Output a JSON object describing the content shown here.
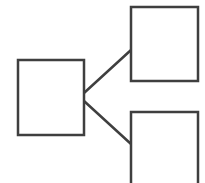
{
  "diagram": {
    "type": "tree",
    "stroke_color": "#3f3f3f",
    "fill_color": "#ffffff",
    "background": "#ffffff",
    "stroke_width": 2.5,
    "nodes": [
      {
        "id": "root",
        "label": "",
        "x": 18,
        "y": 60,
        "w": 66,
        "h": 75
      },
      {
        "id": "child-top",
        "label": "",
        "x": 131,
        "y": 7,
        "w": 67,
        "h": 74
      },
      {
        "id": "child-bottom",
        "label": "",
        "x": 131,
        "y": 112,
        "w": 67,
        "h": 80
      }
    ],
    "edges": [
      {
        "from": "root",
        "to": "child-top",
        "x1": 84,
        "y1": 93,
        "x2": 131,
        "y2": 50
      },
      {
        "from": "root",
        "to": "child-bottom",
        "x1": 84,
        "y1": 101,
        "x2": 131,
        "y2": 144
      }
    ]
  }
}
